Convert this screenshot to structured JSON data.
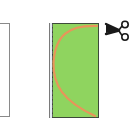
{
  "diagram": {
    "left_panel": {
      "fill": "#ffffff",
      "border": "#8a8a8a"
    },
    "cut_panel": {
      "fill": "#8fd45f",
      "border": "#3d4a3a",
      "edge_strip": "#dfe8f0",
      "cut_line_color": "#e8955a",
      "cut_line_shape": "C-shaped arc from top-right to left-middle to bottom-right"
    },
    "icons": {
      "scissors": "scissors-icon"
    },
    "colors": {
      "green": "#8fd45f",
      "orange": "#e8955a",
      "border_dark": "#3d4a3a",
      "border_gray": "#8a8a8a"
    }
  }
}
